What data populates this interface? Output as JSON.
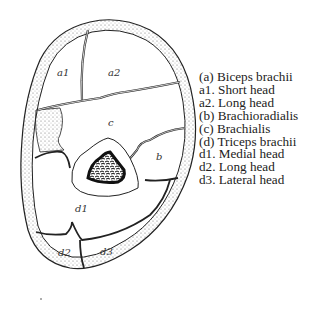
{
  "diagram": {
    "region_labels": {
      "a1": "a1",
      "a2": "a2",
      "b": "b",
      "c": "c",
      "d1": "d1",
      "d2": "d2",
      "d3": "d3"
    }
  },
  "legend": {
    "items": [
      "(a) Biceps brachii",
      "a1. Short head",
      "a2. Long head",
      "(b) Brachioradialis",
      "(c) Brachialis",
      "(d) Triceps brachii",
      "d1. Medial head",
      "d2. Long head",
      "d3. Lateral head"
    ]
  },
  "colors": {
    "stroke": "#222222",
    "bone": "#111111",
    "background": "#ffffff"
  }
}
